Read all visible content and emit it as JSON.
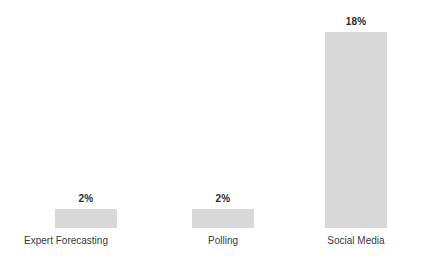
{
  "chart_data": {
    "type": "bar",
    "title": "",
    "subtitle": "",
    "xlabel": "",
    "ylabel": "",
    "categories": [
      "Expert Forecasting",
      "Polling",
      "Social Media"
    ],
    "values": [
      2,
      2,
      18
    ],
    "value_labels": [
      "2%",
      "18%",
      "2%"
    ],
    "value_suffix": "%",
    "ylim": [
      0,
      21
    ],
    "grid": false,
    "legend": false,
    "axis_lines": false,
    "bar_color": "#d8d8d8",
    "value_label_color": "#2b2b2b",
    "category_label_color": "#3a3a3a",
    "background_color": "#ffffff",
    "bars": [
      {
        "category": "Expert Forecasting",
        "value": 2,
        "label": "2%",
        "height_px": 19
      },
      {
        "category": "Polling",
        "value": 2,
        "label": "2%",
        "height_px": 19
      },
      {
        "category": "Social Media",
        "value": 18,
        "label": "18%",
        "height_px": 196
      }
    ]
  }
}
